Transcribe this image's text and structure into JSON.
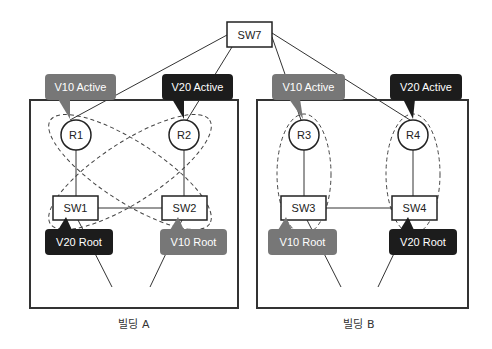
{
  "colors": {
    "v10": "#777777",
    "v20": "#1c1c1c",
    "line": "#333333",
    "dash": "#444444",
    "label_text": "#ffffff"
  },
  "core_switch": {
    "label": "SW7"
  },
  "buildings": [
    {
      "caption": "빌딩 A",
      "routers": [
        {
          "label": "R1",
          "callout": "V10 Active",
          "vlan": "v10"
        },
        {
          "label": "R2",
          "callout": "V20 Active",
          "vlan": "v20"
        }
      ],
      "switches": [
        {
          "label": "SW1",
          "callout": "V20 Root",
          "vlan": "v20"
        },
        {
          "label": "SW2",
          "callout": "V10 Root",
          "vlan": "v10"
        }
      ],
      "topology": "crossed-ellipses"
    },
    {
      "caption": "빌딩 B",
      "routers": [
        {
          "label": "R3",
          "callout": "V10 Active",
          "vlan": "v10"
        },
        {
          "label": "R4",
          "callout": "V20 Active",
          "vlan": "v20"
        }
      ],
      "switches": [
        {
          "label": "SW3",
          "callout": "V10 Root",
          "vlan": "v10"
        },
        {
          "label": "SW4",
          "callout": "V20 Root",
          "vlan": "v20"
        }
      ],
      "topology": "vertical-ellipses"
    }
  ]
}
